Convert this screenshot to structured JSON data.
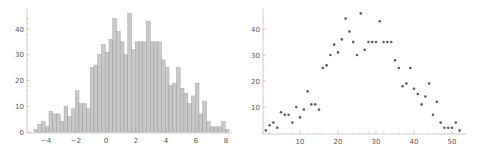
{
  "chart_data": [
    {
      "type": "bar",
      "title": "",
      "xlabel": "",
      "ylabel": "",
      "bin_start": -4.8,
      "bin_width": 0.25,
      "xlim": [
        -5,
        8.2
      ],
      "ylim": [
        0,
        46
      ],
      "xticks": [
        -4,
        -2,
        0,
        2,
        4,
        6,
        8
      ],
      "yticks": [
        0,
        10,
        20,
        30,
        40
      ],
      "grid": false,
      "values": [
        1,
        3,
        4,
        2,
        8,
        7,
        7,
        4,
        10,
        6,
        9,
        16,
        11,
        11,
        9,
        25,
        26,
        30,
        34,
        31,
        36,
        44,
        39,
        35,
        30,
        46,
        32,
        35,
        35,
        35,
        43,
        35,
        35,
        35,
        28,
        25,
        18,
        19,
        25,
        17,
        15,
        11,
        14,
        19,
        7,
        12,
        4,
        2,
        2,
        2,
        4,
        1
      ],
      "color": "#c8c8c8"
    },
    {
      "type": "scatter",
      "title": "",
      "xlabel": "",
      "ylabel": "",
      "xlim": [
        0,
        53
      ],
      "ylim": [
        0,
        46
      ],
      "xticks": [
        10,
        20,
        30,
        40,
        50
      ],
      "yticks": [
        10,
        20,
        30,
        40
      ],
      "grid": false,
      "x": [
        1,
        2,
        3,
        4,
        5,
        6,
        7,
        8,
        9,
        10,
        11,
        12,
        13,
        14,
        15,
        16,
        17,
        18,
        19,
        20,
        21,
        22,
        23,
        24,
        25,
        26,
        27,
        28,
        29,
        30,
        31,
        32,
        33,
        34,
        35,
        36,
        37,
        38,
        39,
        40,
        41,
        42,
        43,
        44,
        45,
        46,
        47,
        48,
        49,
        50,
        51,
        52
      ],
      "y": [
        1,
        3,
        4,
        2,
        8,
        7,
        7,
        4,
        10,
        6,
        9,
        16,
        11,
        11,
        9,
        25,
        26,
        30,
        34,
        31,
        36,
        44,
        39,
        35,
        30,
        46,
        32,
        35,
        35,
        35,
        43,
        35,
        35,
        35,
        28,
        25,
        18,
        19,
        25,
        17,
        15,
        11,
        14,
        19,
        7,
        12,
        4,
        2,
        2,
        2,
        4,
        1
      ],
      "color": "#5a5a5a"
    }
  ]
}
